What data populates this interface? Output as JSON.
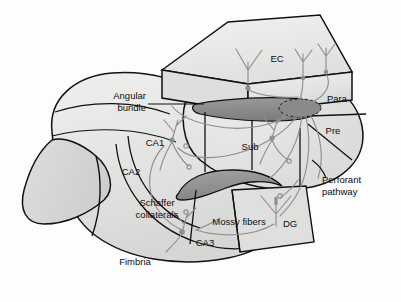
{
  "figure": {
    "background_color": "#fdfdfd",
    "outline_color": "#111111",
    "fill_light": "#e9e9e7",
    "fill_mid": "#dcdcda",
    "fill_shade": "#cfcfcd",
    "fill_dark_band": "#8b8b8b",
    "fill_dark_band_2": "#9a9a9a",
    "neuron_color": "#8f8f8f",
    "text_color": "#0d0d0d"
  },
  "regions": [
    {
      "id": "ec",
      "label": "EC",
      "name": "entorhinal-cortex"
    },
    {
      "id": "para",
      "label": "Para",
      "name": "parasubiculum"
    },
    {
      "id": "pre",
      "label": "Pre",
      "name": "presubiculum"
    },
    {
      "id": "sub",
      "label": "Sub",
      "name": "subiculum"
    },
    {
      "id": "ca1",
      "label": "CA1",
      "name": "ca1-field"
    },
    {
      "id": "ca2",
      "label": "CA2",
      "name": "ca2-field"
    },
    {
      "id": "ca3",
      "label": "CA3",
      "name": "ca3-field"
    },
    {
      "id": "dg",
      "label": "DG",
      "name": "dentate-gyrus"
    },
    {
      "id": "fimbria",
      "label": "Fimbria",
      "name": "fimbria"
    }
  ],
  "pathways": [
    {
      "id": "angular",
      "label_line1": "Angular",
      "label_line2": "bundle",
      "name": "angular-bundle"
    },
    {
      "id": "perforant",
      "label_line1": "Perforant",
      "label_line2": "pathway",
      "name": "perforant-pathway"
    },
    {
      "id": "schaffer",
      "label_line1": "Schaffer",
      "label_line2": "collaterals",
      "name": "schaffer-collaterals"
    },
    {
      "id": "mossy",
      "label_line1": "Mossy fibers",
      "label_line2": "",
      "name": "mossy-fibers"
    }
  ]
}
